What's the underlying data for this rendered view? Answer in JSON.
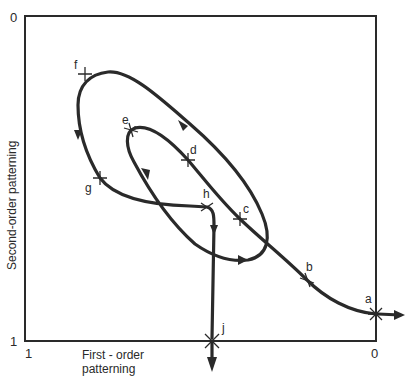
{
  "diagram": {
    "axes": {
      "x_label_line1": "First - order",
      "x_label_line2": "patterning",
      "y_label": "Second-order patterning",
      "y_top_tick": "0",
      "y_bottom_tick": "1",
      "x_left_tick": "1",
      "x_right_tick": "0"
    },
    "points": [
      {
        "id": "a",
        "label": "a"
      },
      {
        "id": "b",
        "label": "b"
      },
      {
        "id": "c",
        "label": "c"
      },
      {
        "id": "d",
        "label": "d"
      },
      {
        "id": "e",
        "label": "e"
      },
      {
        "id": "f",
        "label": "f"
      },
      {
        "id": "g",
        "label": "g"
      },
      {
        "id": "h",
        "label": "h"
      },
      {
        "id": "j",
        "label": "j"
      }
    ],
    "path_order": [
      "a",
      "b",
      "c",
      "d",
      "e",
      "f",
      "g",
      "h",
      "j"
    ],
    "colors": {
      "line": "#2a2a2a",
      "background": "#ffffff"
    }
  }
}
